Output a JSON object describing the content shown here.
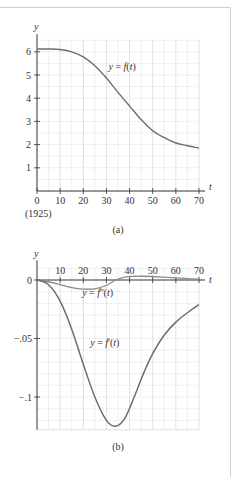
{
  "chart_data": [
    {
      "id": "a",
      "type": "line",
      "caption": "(a)",
      "xlabel": "t",
      "ylabel": "y",
      "x_ticks": [
        0,
        10,
        20,
        30,
        40,
        50,
        60,
        70
      ],
      "x_tick_note": "(1925)",
      "y_ticks": [
        1,
        2,
        3,
        4,
        5,
        6
      ],
      "xlim": [
        0,
        70
      ],
      "ylim": [
        0,
        6.5
      ],
      "grid": true,
      "series": [
        {
          "name": "y = f(t)",
          "x": [
            0,
            5,
            10,
            15,
            20,
            25,
            30,
            35,
            40,
            45,
            50,
            55,
            60,
            65,
            70
          ],
          "values": [
            6.12,
            6.12,
            6.1,
            6.0,
            5.78,
            5.4,
            4.87,
            4.25,
            3.66,
            3.08,
            2.6,
            2.3,
            2.07,
            1.95,
            1.85
          ]
        }
      ],
      "annotations": [
        {
          "text": "y = f(t)",
          "x": 30,
          "y": 5.2
        }
      ]
    },
    {
      "id": "b",
      "type": "line",
      "caption": "(b)",
      "xlabel": "t",
      "ylabel": "y",
      "x_ticks": [
        10,
        20,
        30,
        40,
        50,
        60,
        70
      ],
      "y_ticks": [
        0,
        -0.05,
        -0.1
      ],
      "y_tick_labels": [
        "0",
        "−.05",
        "−.1"
      ],
      "xlim": [
        0,
        70
      ],
      "ylim": [
        -0.128,
        0.01
      ],
      "grid": true,
      "series": [
        {
          "name": "y = f'(t)",
          "x": [
            0,
            5,
            10,
            15,
            20,
            25,
            30,
            34,
            38,
            42,
            46,
            50,
            55,
            60,
            65,
            70
          ],
          "values": [
            0,
            -0.004,
            -0.018,
            -0.042,
            -0.072,
            -0.1,
            -0.12,
            -0.125,
            -0.118,
            -0.1,
            -0.08,
            -0.063,
            -0.047,
            -0.036,
            -0.028,
            -0.021
          ]
        },
        {
          "name": "y = f''(t)",
          "x": [
            0,
            5,
            10,
            15,
            20,
            25,
            30,
            34,
            38,
            42,
            46,
            50,
            55,
            60,
            65,
            70
          ],
          "values": [
            0,
            -0.0015,
            -0.004,
            -0.0065,
            -0.0078,
            -0.0075,
            -0.0045,
            0,
            0.0025,
            0.0032,
            0.0032,
            0.003,
            0.0024,
            0.0018,
            0.0012,
            0.0008
          ]
        }
      ],
      "annotations": [
        {
          "text": "y = f''(t)",
          "x": 19.5,
          "y": -0.0135
        },
        {
          "text": "y = f'(t)",
          "x": 23,
          "y": -0.056
        }
      ]
    }
  ],
  "style": {
    "curve_color": "#6e6e6e",
    "curve2_color": "#8a8a8a",
    "axis_color": "#333333",
    "grid_color": "#cccccc",
    "frame_color": "#cfcfcf"
  }
}
